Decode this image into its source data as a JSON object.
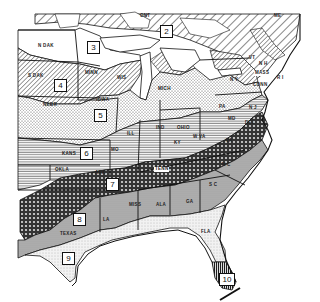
{
  "map": {
    "title": "Plant Hardiness Zones — Eastern United States",
    "colors": {
      "ink": "#111111",
      "paper": "#ffffff",
      "zone8_fill": "#a9a9a9",
      "zone7_fill": "#555555",
      "zone9_fill": "#e6e6e6"
    },
    "zones": [
      {
        "id": "2",
        "label": "2",
        "pattern": "diagonal-hatch-wide"
      },
      {
        "id": "3",
        "label": "3",
        "pattern": "blank"
      },
      {
        "id": "4",
        "label": "4",
        "pattern": "diagonal-hatch"
      },
      {
        "id": "5",
        "label": "5",
        "pattern": "dotted"
      },
      {
        "id": "6",
        "label": "6",
        "pattern": "horizontal-lines"
      },
      {
        "id": "7",
        "label": "7",
        "pattern": "cross-hatch-dark"
      },
      {
        "id": "8",
        "label": "8",
        "pattern": "gray-stipple"
      },
      {
        "id": "9",
        "label": "9",
        "pattern": "light-stipple"
      },
      {
        "id": "10",
        "label": "10",
        "pattern": "vertical-lines-dark"
      }
    ],
    "states": {
      "ont": "ONT",
      "n_dak": "N DAK",
      "s_dak": "S DAK",
      "nebr": "NEBR",
      "minn": "MINN",
      "wis": "WIS",
      "iowa": "IOWA",
      "mich": "MICH",
      "ill": "ILL",
      "ind": "IND",
      "ohio": "OHIO",
      "pa": "PA",
      "ny": "N Y",
      "me": "ME",
      "vt": "VT",
      "nh": "N H",
      "mass": "MASS",
      "ri": "R I",
      "conn": "CONN",
      "nj": "N J",
      "md": "MD",
      "del": "DEL",
      "w_va": "W VA",
      "va": "VA",
      "ky": "KY",
      "kans": "KANS",
      "mo": "MO",
      "okla": "OKLA",
      "ark": "ARK",
      "tenn": "TENN",
      "nc": "N C",
      "sc": "S C",
      "ga": "GA",
      "ala": "ALA",
      "miss": "MISS",
      "la": "LA",
      "texas": "TEXAS",
      "fla": "FLA"
    }
  }
}
